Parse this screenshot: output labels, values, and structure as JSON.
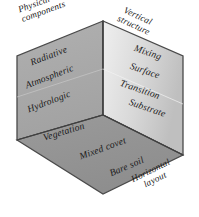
{
  "figure": {
    "type": "cube-diagram",
    "title": "",
    "faces": [
      {
        "name": "left-face",
        "axis_label": "Physical components",
        "axis_label_line1": "Physical",
        "axis_label_line2": "components",
        "fill": "#a8a8a8",
        "categories": [
          "Radiative",
          "Atmospheric",
          "Hydrologic",
          "Vegetation"
        ]
      },
      {
        "name": "right-face",
        "axis_label": "Vertical structure",
        "axis_label_line1": "Vertical",
        "axis_label_line2": "structure",
        "fill": "#e6e6e6",
        "categories": [
          "Mixing",
          "Surface",
          "Transition",
          "Substrate"
        ]
      },
      {
        "name": "bottom-face",
        "axis_label": "Horizontal layout",
        "axis_label_line1": "Horizontal",
        "axis_label_line2": "layout",
        "fill": "#929292",
        "categories": [
          "Vegetation",
          "Mixed cover",
          "Bare soil"
        ]
      }
    ],
    "labels": {
      "physical_components_1": "Physical",
      "physical_components_2": "components",
      "vertical_structure_1": "Vertical",
      "vertical_structure_2": "structure",
      "horizontal_layout_1": "Horizontal",
      "horizontal_layout_2": "layout",
      "radiative": "Radiative",
      "atmospheric": "Atmospheric",
      "hydrologic": "Hydrologic",
      "vegetation_left": "Vegetation",
      "mixing": "Mixing",
      "surface": "Surface",
      "transition": "Transition",
      "substrate": "Substrate",
      "mixed_cover": "Mixed covet",
      "bare_soil": "Bare soil"
    },
    "colors": {
      "outline": "#4a4a4a",
      "left_fill": "#a8a8a8",
      "right_fill_light": "#eeeeee",
      "right_fill_dark": "#bdbdbd",
      "bottom_fill": "#929292",
      "text": "#1a1a1a"
    }
  }
}
